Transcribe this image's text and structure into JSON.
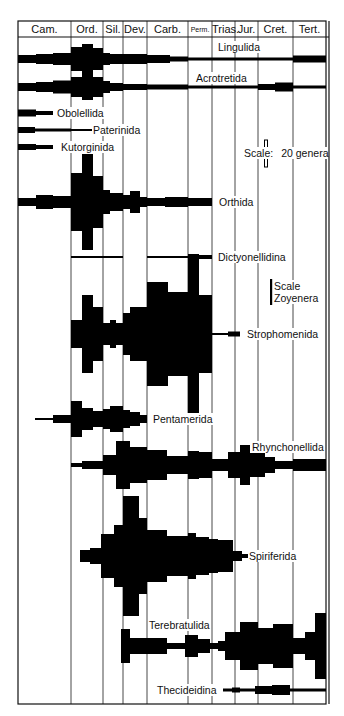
{
  "frame": {
    "left": 18,
    "right": 326,
    "outer_right": 329,
    "top": 21,
    "header_bottom": 37,
    "bottom": 704
  },
  "periods": [
    {
      "label": "Cam.",
      "x0": 18,
      "x1": 71,
      "small": false
    },
    {
      "label": "Ord.",
      "x0": 71,
      "x1": 103,
      "small": false
    },
    {
      "label": "Sil.",
      "x0": 103,
      "x1": 123,
      "small": false
    },
    {
      "label": "Dev.",
      "x0": 123,
      "x1": 147,
      "small": false
    },
    {
      "label": "Carb.",
      "x0": 147,
      "x1": 188,
      "small": false
    },
    {
      "label": "Perm.",
      "x0": 188,
      "x1": 212,
      "small": true
    },
    {
      "label": "Trias.",
      "x0": 212,
      "x1": 235,
      "small": false
    },
    {
      "label": "Jur.",
      "x0": 235,
      "x1": 258,
      "small": false
    },
    {
      "label": "Cret.",
      "x0": 258,
      "x1": 293,
      "small": false
    },
    {
      "label": "Tert.",
      "x0": 293,
      "x1": 326,
      "small": false
    }
  ],
  "scales": [
    {
      "prefix": "Scale:",
      "text": "20 genera",
      "bar_x": 266,
      "bar_y0": 140,
      "bar_y1": 167,
      "boxed": true,
      "label_x": 244,
      "label_y": 147
    },
    {
      "prefix": "Scale",
      "text": "Zoyenera",
      "bar_x": 271,
      "bar_y0": 279,
      "bar_y1": 305,
      "boxed": false,
      "label_x": 274,
      "label_y": 280
    }
  ],
  "taxa": [
    {
      "name": "Lingulida",
      "cy": 59,
      "label_x": 217,
      "label_y": 41,
      "segments": [
        [
          18,
          36,
          8
        ],
        [
          36,
          53,
          10
        ],
        [
          53,
          71,
          12
        ],
        [
          71,
          82,
          24
        ],
        [
          82,
          93,
          30
        ],
        [
          93,
          103,
          22
        ],
        [
          103,
          110,
          12
        ],
        [
          110,
          123,
          10
        ],
        [
          123,
          147,
          10
        ],
        [
          147,
          170,
          8
        ],
        [
          170,
          188,
          5
        ],
        [
          188,
          293,
          3
        ],
        [
          293,
          326,
          7
        ]
      ]
    },
    {
      "name": "Acrotretida",
      "cy": 87,
      "label_x": 195,
      "label_y": 72,
      "segments": [
        [
          18,
          36,
          8
        ],
        [
          36,
          53,
          10
        ],
        [
          53,
          71,
          13
        ],
        [
          71,
          82,
          20
        ],
        [
          82,
          93,
          26
        ],
        [
          93,
          103,
          20
        ],
        [
          103,
          110,
          12
        ],
        [
          110,
          123,
          8
        ],
        [
          123,
          147,
          6
        ],
        [
          147,
          188,
          5
        ],
        [
          188,
          258,
          3
        ],
        [
          258,
          275,
          6
        ],
        [
          275,
          293,
          9
        ],
        [
          293,
          326,
          3
        ]
      ]
    },
    {
      "name": "Obolellida",
      "cy": 113,
      "label_x": 56,
      "label_y": 107,
      "segments": [
        [
          18,
          36,
          7
        ],
        [
          36,
          53,
          4
        ]
      ]
    },
    {
      "name": "Paterinida",
      "cy": 130,
      "label_x": 92,
      "label_y": 124,
      "segments": [
        [
          18,
          35,
          6
        ],
        [
          35,
          71,
          3
        ],
        [
          71,
          92,
          2
        ]
      ]
    },
    {
      "name": "Kutorginida",
      "cy": 147,
      "label_x": 60,
      "label_y": 141,
      "segments": [
        [
          18,
          36,
          6
        ],
        [
          36,
          53,
          4
        ]
      ]
    }
  ],
  "taxa2": [
    {
      "name": "Orthida",
      "cy": 202,
      "label_x": 218,
      "label_y": 196,
      "segments": [
        [
          18,
          36,
          8
        ],
        [
          36,
          53,
          14
        ],
        [
          53,
          71,
          12
        ],
        [
          71,
          82,
          58
        ],
        [
          82,
          93,
          96
        ],
        [
          93,
          103,
          52
        ],
        [
          103,
          110,
          24
        ],
        [
          110,
          123,
          18
        ],
        [
          123,
          130,
          14
        ],
        [
          130,
          140,
          22
        ],
        [
          140,
          147,
          10
        ],
        [
          147,
          165,
          8
        ],
        [
          165,
          188,
          10
        ],
        [
          188,
          212,
          8
        ]
      ]
    },
    {
      "name": "Dictyonellidina",
      "cy": 257,
      "label_x": 217,
      "label_y": 251,
      "segments": [
        [
          71,
          123,
          2
        ],
        [
          147,
          188,
          2
        ],
        [
          188,
          212,
          4
        ]
      ]
    },
    {
      "name": "Strophomenida",
      "cy": 334,
      "label_x": 246,
      "label_y": 328,
      "segments": [
        [
          71,
          82,
          28
        ],
        [
          82,
          93,
          78
        ],
        [
          93,
          103,
          54
        ],
        [
          103,
          110,
          22
        ],
        [
          110,
          116,
          28
        ],
        [
          116,
          123,
          22
        ],
        [
          123,
          130,
          42
        ],
        [
          130,
          147,
          54
        ],
        [
          147,
          168,
          104
        ],
        [
          168,
          188,
          84
        ],
        [
          188,
          199,
          160
        ],
        [
          199,
          212,
          78
        ],
        [
          212,
          228,
          2
        ],
        [
          228,
          240,
          5
        ]
      ]
    },
    {
      "name": "Pentamerida",
      "cy": 419,
      "label_x": 152,
      "label_y": 413,
      "segments": [
        [
          35,
          53,
          2
        ],
        [
          53,
          71,
          8
        ],
        [
          71,
          82,
          36
        ],
        [
          82,
          93,
          22
        ],
        [
          93,
          103,
          16
        ],
        [
          103,
          110,
          20
        ],
        [
          110,
          123,
          26
        ],
        [
          123,
          130,
          18
        ],
        [
          130,
          140,
          14
        ],
        [
          140,
          147,
          8
        ]
      ]
    },
    {
      "name": "Rhynchonellida",
      "cy": 465,
      "label_x": 251,
      "label_y": 441,
      "segments": [
        [
          71,
          82,
          4
        ],
        [
          82,
          103,
          8
        ],
        [
          103,
          116,
          20
        ],
        [
          116,
          130,
          48
        ],
        [
          130,
          147,
          36
        ],
        [
          147,
          167,
          30
        ],
        [
          167,
          188,
          18
        ],
        [
          188,
          199,
          28
        ],
        [
          199,
          212,
          26
        ],
        [
          212,
          228,
          12
        ],
        [
          228,
          240,
          26
        ],
        [
          240,
          250,
          40
        ],
        [
          250,
          265,
          24
        ],
        [
          265,
          275,
          16
        ],
        [
          275,
          293,
          8
        ],
        [
          293,
          305,
          12
        ],
        [
          305,
          326,
          12
        ]
      ]
    },
    {
      "name": "Spiriferida",
      "cy": 556,
      "label_x": 248,
      "label_y": 550,
      "segments": [
        [
          80,
          90,
          12
        ],
        [
          90,
          101,
          16
        ],
        [
          101,
          114,
          44
        ],
        [
          114,
          123,
          62
        ],
        [
          123,
          139,
          120
        ],
        [
          139,
          147,
          76
        ],
        [
          147,
          167,
          52
        ],
        [
          167,
          188,
          40
        ],
        [
          188,
          196,
          46
        ],
        [
          196,
          209,
          38
        ],
        [
          209,
          218,
          34
        ],
        [
          218,
          233,
          32
        ],
        [
          233,
          242,
          10
        ],
        [
          242,
          248,
          4
        ]
      ]
    },
    {
      "name": "Terebratulida",
      "cy": 646,
      "label_x": 148,
      "label_y": 619,
      "segments": [
        [
          121,
          130,
          34
        ],
        [
          130,
          145,
          16
        ],
        [
          145,
          167,
          16
        ],
        [
          167,
          185,
          6
        ],
        [
          185,
          198,
          22
        ],
        [
          198,
          210,
          14
        ],
        [
          210,
          218,
          6
        ],
        [
          218,
          225,
          10
        ],
        [
          225,
          240,
          28
        ],
        [
          240,
          258,
          48
        ],
        [
          258,
          273,
          36
        ],
        [
          273,
          293,
          44
        ],
        [
          293,
          305,
          16
        ],
        [
          305,
          315,
          28
        ],
        [
          315,
          326,
          66
        ]
      ]
    },
    {
      "name": "Thecideidina",
      "cy": 690,
      "label_x": 156,
      "label_y": 684,
      "segments": [
        [
          223,
          232,
          3
        ],
        [
          232,
          240,
          5
        ],
        [
          240,
          255,
          3
        ],
        [
          255,
          272,
          8
        ],
        [
          272,
          290,
          10
        ],
        [
          290,
          326,
          3
        ]
      ]
    }
  ]
}
